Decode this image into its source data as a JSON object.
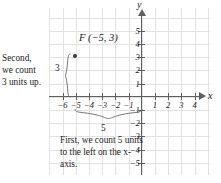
{
  "figure": {
    "type": "coordinate-plane-plot",
    "point_label": "F (−5, 3)",
    "axis_x_name": "x",
    "axis_y_name": "y"
  },
  "annotations": {
    "second_line1": "Second,",
    "second_line2": "we count",
    "second_line3": "3 units up.",
    "vertical_brace_value": "3",
    "first_text": "First, we count 5 units to the left on the x-axis.",
    "horizontal_brace_value": "5"
  },
  "axis_labels": {
    "x": [
      "−6",
      "−5",
      "−4",
      "−3",
      "−2",
      "−1",
      "1",
      "2",
      "3",
      "4"
    ],
    "y": [
      "5",
      "4",
      "3",
      "2",
      "1",
      "−1",
      "−2",
      "−3",
      "−4",
      "−5"
    ]
  },
  "colors": {
    "grid": "#e2e2e2",
    "axis": "#5f5f5f",
    "text": "#1a1a1a",
    "point": "#3a3a3a",
    "background": "#ffffff"
  },
  "chart_data": {
    "type": "scatter",
    "title": "",
    "xlabel": "x",
    "ylabel": "y",
    "xlim": [
      -7,
      5
    ],
    "ylim": [
      -6,
      6
    ],
    "xticks": [
      -6,
      -5,
      -4,
      -3,
      -2,
      -1,
      1,
      2,
      3,
      4
    ],
    "yticks": [
      5,
      4,
      3,
      2,
      1,
      -1,
      -2,
      -3,
      -4,
      -5
    ],
    "grid": true,
    "legend": "none",
    "points": [
      {
        "label": "F",
        "x": -5,
        "y": 3,
        "display": "F (−5, 3)"
      }
    ],
    "annotations": [
      {
        "text": "Second, we count 3 units up.",
        "value": 3,
        "brace": "vertical",
        "brace_from": [
          -5,
          0
        ],
        "brace_to": [
          -5,
          3
        ]
      },
      {
        "text": "First, we count 5 units to the left on the x-axis.",
        "value": 5,
        "brace": "horizontal",
        "brace_from": [
          -5,
          0
        ],
        "brace_to": [
          0,
          0
        ]
      }
    ]
  }
}
